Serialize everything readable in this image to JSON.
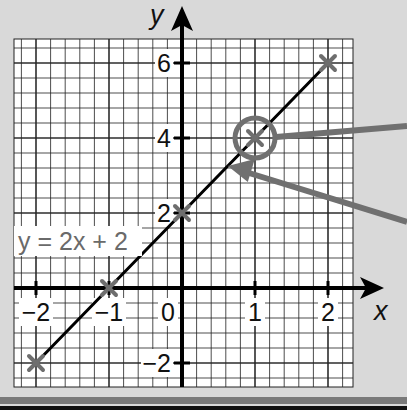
{
  "chart_data": {
    "type": "line",
    "title": "",
    "equation_label": "y = 2x + 2",
    "xlabel": "x",
    "ylabel": "y",
    "xlim": [
      -2.3,
      2.35
    ],
    "ylim": [
      -2.6,
      6.6
    ],
    "x_ticks": [
      -2,
      -1,
      0,
      1,
      2
    ],
    "x_tick_labels": [
      "−2",
      "−1",
      "0",
      "1",
      "2"
    ],
    "y_ticks": [
      -2,
      2,
      4,
      6
    ],
    "y_tick_labels": [
      "−2",
      "2",
      "4",
      "6"
    ],
    "grid": true,
    "series": [
      {
        "name": "y = 2x + 2",
        "x": [
          -2,
          -1,
          0,
          1,
          2
        ],
        "y": [
          -2,
          0,
          2,
          4,
          6
        ],
        "markers": "cross"
      }
    ],
    "annotations": [
      {
        "type": "circle",
        "x": 1,
        "y": 4,
        "note": "highlighted point (1, 4) with pointer arrow leading off-chart right"
      },
      {
        "type": "arrow",
        "points_to": [
          0.6,
          3.2
        ],
        "note": "arrow pointing at the line from off-chart right"
      }
    ]
  },
  "labels": {
    "x_axis": "x",
    "y_axis": "y",
    "equation": "y = 2x + 2",
    "origin": "0"
  },
  "colors": {
    "background": "#d9d9d9",
    "grid_paper": "#ffffff",
    "grid_line": "#222222",
    "axis": "#000000",
    "line": "#000000",
    "marker": "#6e6e6e",
    "annotation": "#707070",
    "equation_text": "#6a6a6a"
  }
}
